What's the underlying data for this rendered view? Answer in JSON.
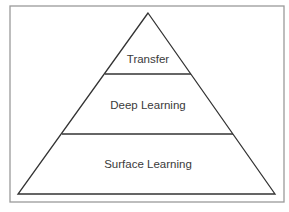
{
  "diagram": {
    "type": "pyramid",
    "levels": [
      {
        "position": "top",
        "label": "Transfer"
      },
      {
        "position": "middle",
        "label": "Deep Learning"
      },
      {
        "position": "bottom",
        "label": "Surface Learning"
      }
    ],
    "colors": {
      "outline": "#333333",
      "frame": "#9a9a9a",
      "text": "#3a3a3a",
      "background": "#ffffff"
    }
  }
}
